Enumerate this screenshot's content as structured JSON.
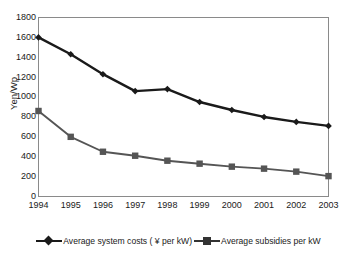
{
  "chart_data": {
    "type": "line",
    "title": "",
    "subtitle": "",
    "xlabel": "",
    "ylabel": "Yen/Wp",
    "categories": [
      "1994",
      "1995",
      "1996",
      "1997",
      "1998",
      "1999",
      "2000",
      "2001",
      "2002",
      "2003"
    ],
    "x": [
      1994,
      1995,
      1996,
      1997,
      1998,
      1999,
      2000,
      2001,
      2002,
      2003
    ],
    "ylim": [
      0,
      1800
    ],
    "ytick_step": 200,
    "yticks": [
      "1800",
      "1600",
      "1400",
      "1200",
      "1000",
      "800",
      "600",
      "400",
      "200",
      "0"
    ],
    "ytick_values": [
      1800,
      1600,
      1400,
      1200,
      1000,
      800,
      600,
      400,
      200,
      0
    ],
    "grid": false,
    "legend_position": "bottom",
    "series": [
      {
        "name": "Average system costs ( ¥ per kW)",
        "marker": "diamond",
        "color": "#1a1a1a",
        "values": [
          1600,
          1430,
          1230,
          1060,
          1080,
          950,
          870,
          800,
          750,
          710
        ]
      },
      {
        "name": "Average subsidies per kW",
        "marker": "square",
        "color": "#555555",
        "values": [
          860,
          600,
          450,
          410,
          360,
          330,
          300,
          280,
          250,
          205
        ]
      }
    ]
  },
  "legend": {
    "items": [
      {
        "label": "Average system costs ( ¥ per kW)",
        "marker": "diamond-marker-icon"
      },
      {
        "label": "Average subsidies per kW",
        "marker": "square-marker-icon"
      }
    ]
  },
  "colors": {
    "series_costs": "#1a1a1a",
    "series_subsidies": "#555555",
    "plot_border": "#8a8a8a",
    "background": "#ffffff",
    "text": "#1a1a1a"
  }
}
